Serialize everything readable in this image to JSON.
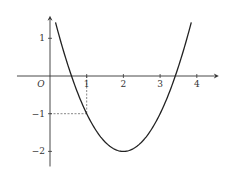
{
  "chart_data": {
    "type": "line",
    "title": "",
    "function": "y = (x - 2)^2 - 2",
    "xlabel": "",
    "ylabel": "",
    "xlim": [
      -0.9,
      4.6
    ],
    "ylim": [
      -2.4,
      1.6
    ],
    "grid": false,
    "origin_label": "O",
    "x_ticks": [
      {
        "value": 1,
        "label": "1"
      },
      {
        "value": 2,
        "label": "2"
      },
      {
        "value": 3,
        "label": "3"
      },
      {
        "value": 4,
        "label": "4"
      }
    ],
    "y_ticks": [
      {
        "value": 1,
        "label": "1"
      },
      {
        "value": -1,
        "label": "−1"
      },
      {
        "value": -2,
        "label": "−2"
      }
    ],
    "series": [
      {
        "name": "parabola",
        "x_range": [
          0.15,
          3.85
        ],
        "vertex": [
          2,
          -2
        ]
      }
    ],
    "guide_point": {
      "x": 1,
      "y": -1
    },
    "colors": {
      "curve": "#222222",
      "axis": "#333333",
      "guide": "#555555"
    }
  }
}
